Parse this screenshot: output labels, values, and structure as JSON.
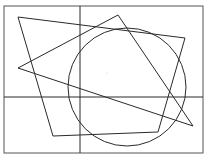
{
  "diagram": {
    "width": 209,
    "height": 157,
    "stroke_color": "#2a2a2a",
    "frame": {
      "x": 4,
      "y": 6,
      "w": 199,
      "h": 147
    },
    "axes": {
      "vertical_x": 80,
      "horizontal_y": 97
    },
    "quadrilateral": {
      "points": "18,17 185,38 158,132 53,136"
    },
    "triangle": {
      "points": "18,68 118,15 193,126"
    },
    "circle": {
      "cx": 127,
      "cy": 87,
      "r": 59
    },
    "center_dot": {
      "cx": 107,
      "cy": 73
    }
  }
}
